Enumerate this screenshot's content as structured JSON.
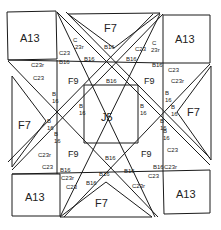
{
  "diagram": {
    "type": "quilt-block-piecing-diagram",
    "colors": {
      "line": "#1a1a1a",
      "text": "#222222",
      "background": "#ffffff"
    },
    "pieces": {
      "center": {
        "label": "J5"
      },
      "corners": [
        {
          "position": "top-left",
          "label": "A13"
        },
        {
          "position": "top-right",
          "label": "A13"
        },
        {
          "position": "bottom-left",
          "label": "A13"
        },
        {
          "position": "bottom-right",
          "label": "A13"
        }
      ],
      "sides": [
        {
          "position": "top",
          "label": "F7"
        },
        {
          "position": "left",
          "label": "F7"
        },
        {
          "position": "right",
          "label": "F7"
        },
        {
          "position": "bottom",
          "label": "F7"
        }
      ],
      "inner_triangles": [
        {
          "position": "top-left",
          "label": "F9"
        },
        {
          "position": "top-right",
          "label": "F9"
        },
        {
          "position": "bottom-left",
          "label": "F9"
        },
        {
          "position": "bottom-right",
          "label": "F9"
        }
      ],
      "small_labels": {
        "b16": "B16",
        "b16_stacked_top": "B",
        "b16_stacked_bottom": "16",
        "c23": "C23",
        "c23r": "C23r",
        "c_stacked_top": "C",
        "c_stacked_bottom": "23r"
      }
    }
  }
}
